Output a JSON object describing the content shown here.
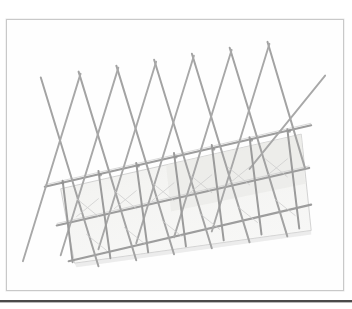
{
  "page": {
    "background_color": "#ffffff",
    "width": 352,
    "height": 309,
    "caption_text": ""
  },
  "frame": {
    "border_color": "#c9c9c9",
    "fill_color": "#fefefe",
    "x": 6,
    "y": 19,
    "width": 338,
    "height": 272
  },
  "bottom_rule": {
    "color": "#4a4a4a",
    "y": 300,
    "thickness": 2
  },
  "drawing": {
    "title": "expandable-lattice-trellis-sketch",
    "medium": "graphite pencil line drawing",
    "stroke_color": "#9a9a9a",
    "stroke_color_light": "#b8b8b8",
    "stroke_color_dark": "#7d7d7d",
    "panel_fill": "#f1f1ef",
    "panel_edge": "#a8a8a8",
    "description": "A perspective sketch of an expanding scissor-lattice gate or trellis panel. Crossed diagonal slats form X shapes above a translucent rectangular panel subdivided by vertical slats and two horizontal rails."
  },
  "chart_data": {
    "type": "line",
    "xlabel": "",
    "ylabel": "",
    "xlim": [
      0,
      352
    ],
    "ylim": [
      309,
      0
    ],
    "grid": false,
    "legend": "none",
    "panel": {
      "name": "translucent-panel",
      "fill": "#f1f1ef",
      "corners": [
        [
          60,
          188
        ],
        [
          300,
          133
        ],
        [
          310,
          230
        ],
        [
          72,
          262
        ]
      ]
    },
    "rails": [
      {
        "name": "top-rail",
        "x": [
          44,
          312
        ],
        "y": [
          186,
          124
        ]
      },
      {
        "name": "mid-rail",
        "x": [
          56,
          310
        ],
        "y": [
          225,
          167
        ]
      },
      {
        "name": "bottom-rail",
        "x": [
          70,
          312
        ],
        "y": [
          261,
          203
        ]
      }
    ],
    "vertical_slats": {
      "name": "vertical-posts",
      "count": 7,
      "top_x": [
        41,
        79,
        117,
        156,
        194,
        233,
        271
      ],
      "top_y": [
        95,
        88,
        82,
        76,
        70,
        64,
        58
      ],
      "bottom_x": [
        60,
        96,
        133,
        170,
        207,
        244,
        281
      ],
      "bottom_y": [
        265,
        259,
        253,
        247,
        241,
        235,
        229
      ]
    },
    "diagonal_slats_right": {
      "name": "diagonals-up-right",
      "count": 7,
      "start_x": [
        22,
        58,
        95,
        132,
        169,
        206,
        243
      ],
      "start_y": [
        262,
        256,
        250,
        244,
        238,
        232,
        226
      ],
      "end_x": [
        82,
        119,
        156,
        193,
        230,
        267,
        325
      ],
      "end_y": [
        88,
        82,
        76,
        70,
        64,
        58,
        74
      ]
    },
    "series": [
      {
        "name": "lattice-nodes-top-rail",
        "values": [
          186,
          178,
          171,
          164,
          157,
          150,
          143
        ]
      }
    ],
    "annotations": [
      {
        "text": "",
        "x": 0,
        "y": 0
      }
    ]
  }
}
